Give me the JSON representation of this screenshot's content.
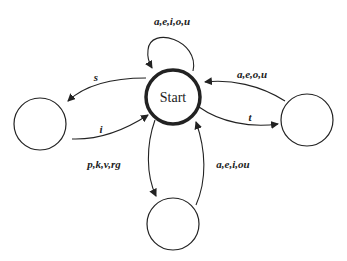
{
  "diagram": {
    "type": "state-transition",
    "states": [
      {
        "id": "start",
        "label": "Start",
        "accepting": false,
        "bold": true
      },
      {
        "id": "left",
        "label": ""
      },
      {
        "id": "right",
        "label": ""
      },
      {
        "id": "bottom",
        "label": ""
      }
    ],
    "transitions": [
      {
        "from": "start",
        "to": "start",
        "label": "a,e,i,o,u"
      },
      {
        "from": "start",
        "to": "left",
        "label": "s"
      },
      {
        "from": "left",
        "to": "start",
        "label": "i"
      },
      {
        "from": "right",
        "to": "start",
        "label": "a,e,o,u"
      },
      {
        "from": "start",
        "to": "right",
        "label": "t"
      },
      {
        "from": "start",
        "to": "bottom",
        "label": "p,k,v,rg"
      },
      {
        "from": "bottom",
        "to": "start",
        "label": "a,e,i,ou"
      }
    ]
  }
}
